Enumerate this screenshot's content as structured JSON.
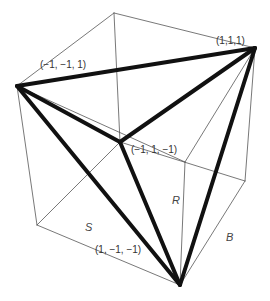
{
  "diagram": {
    "type": "cube-with-inscribed-tetrahedron",
    "vertices": {
      "A": {
        "x": 17,
        "y": 86,
        "label": "(−1, −1, 1)"
      },
      "B": {
        "x": 114,
        "y": 13,
        "label": ""
      },
      "C": {
        "x": 255,
        "y": 48,
        "label": "(1,1,1)"
      },
      "D": {
        "x": 185,
        "y": 162,
        "label": ""
      },
      "E": {
        "x": 120,
        "y": 142,
        "label": "(−1, 1, −1)"
      },
      "F": {
        "x": 245,
        "y": 181,
        "label": ""
      },
      "G": {
        "x": 37,
        "y": 225,
        "label": ""
      },
      "H": {
        "x": 180,
        "y": 285,
        "label": "(1, −1, −1)"
      }
    },
    "cube_edges": [
      [
        "A",
        "B"
      ],
      [
        "B",
        "C"
      ],
      [
        "A",
        "D"
      ],
      [
        "D",
        "C"
      ],
      [
        "B",
        "E"
      ],
      [
        "E",
        "F"
      ],
      [
        "C",
        "F"
      ],
      [
        "A",
        "G"
      ],
      [
        "E",
        "G"
      ],
      [
        "G",
        "H"
      ],
      [
        "D",
        "H"
      ],
      [
        "F",
        "H"
      ]
    ],
    "tetrahedron_edges": [
      [
        "A",
        "C"
      ],
      [
        "A",
        "E"
      ],
      [
        "A",
        "H"
      ],
      [
        "C",
        "E"
      ],
      [
        "C",
        "H"
      ],
      [
        "E",
        "H"
      ]
    ],
    "colors": {
      "cube_edge": "#555555",
      "tetra_edge": "#111111"
    },
    "face_labels": {
      "S": "S",
      "R": "R",
      "B": "B"
    }
  }
}
